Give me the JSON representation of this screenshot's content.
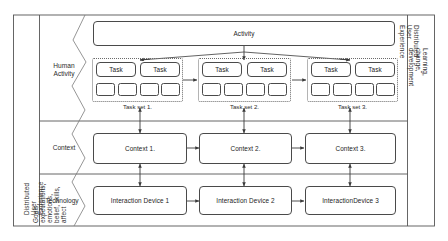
{
  "figure": {
    "background_color": "#ffffff",
    "stroke_color": "#4a4a4a"
  },
  "side_labels": {
    "left": {
      "line1": "Distributed User Experience",
      "line2": "Goals, expectations, emotions, belief, skills, affect"
    },
    "right": {
      "line1": "Distributed User Experience",
      "line2": "Learning, change, development"
    }
  },
  "rows": [
    {
      "id": "human-activity",
      "label_line1": "Human",
      "label_line2": "Activity"
    },
    {
      "id": "context",
      "label_line1": "Context",
      "label_line2": ""
    },
    {
      "id": "technology",
      "label_line1": "Technology",
      "label_line2": ""
    }
  ],
  "activity": {
    "label": "Activity"
  },
  "task_sets": [
    {
      "caption": "Task set 1.",
      "tasks": [
        "Task",
        "Task"
      ],
      "subtasks": [
        "",
        "",
        "",
        ""
      ]
    },
    {
      "caption": "Task set 2.",
      "tasks": [
        "Task",
        "Task"
      ],
      "subtasks": [
        "",
        "",
        "",
        ""
      ]
    },
    {
      "caption": "Task set 3.",
      "tasks": [
        "Task",
        "Task"
      ],
      "subtasks": [
        "",
        "",
        "",
        ""
      ]
    }
  ],
  "contexts": [
    {
      "label": "Context 1."
    },
    {
      "label": "Context 2."
    },
    {
      "label": "Context 3."
    }
  ],
  "devices": [
    {
      "label": "Interaction Device 1"
    },
    {
      "label": "Interaction Device 2"
    },
    {
      "label": "InteractionDevice 3"
    }
  ]
}
